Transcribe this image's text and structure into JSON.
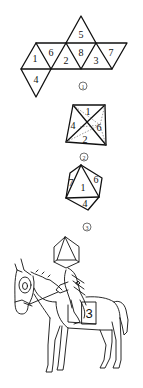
{
  "figure1": {
    "caption": "1",
    "faces": [
      {
        "id": "f5",
        "label": "5"
      },
      {
        "id": "f1",
        "label": "1"
      },
      {
        "id": "f6",
        "label": "6"
      },
      {
        "id": "f2",
        "label": "2"
      },
      {
        "id": "f8",
        "label": "8"
      },
      {
        "id": "f3",
        "label": "3"
      },
      {
        "id": "f7",
        "label": "7"
      },
      {
        "id": "f4",
        "label": "4"
      }
    ]
  },
  "figure2": {
    "caption": "2",
    "faces": [
      {
        "id": "top",
        "label": "1"
      },
      {
        "id": "left",
        "label": "4"
      },
      {
        "id": "right",
        "label": "6"
      },
      {
        "id": "bottom",
        "label": "2"
      }
    ]
  },
  "figure3": {
    "caption": "3",
    "faces": [
      {
        "id": "left",
        "label": "7"
      },
      {
        "id": "center",
        "label": "1"
      },
      {
        "id": "right",
        "label": "6"
      },
      {
        "id": "bottom",
        "label": "4"
      }
    ]
  },
  "figure4": {
    "saddle_number": "3"
  },
  "colors": {
    "line": "#111111",
    "background": "#ffffff"
  }
}
